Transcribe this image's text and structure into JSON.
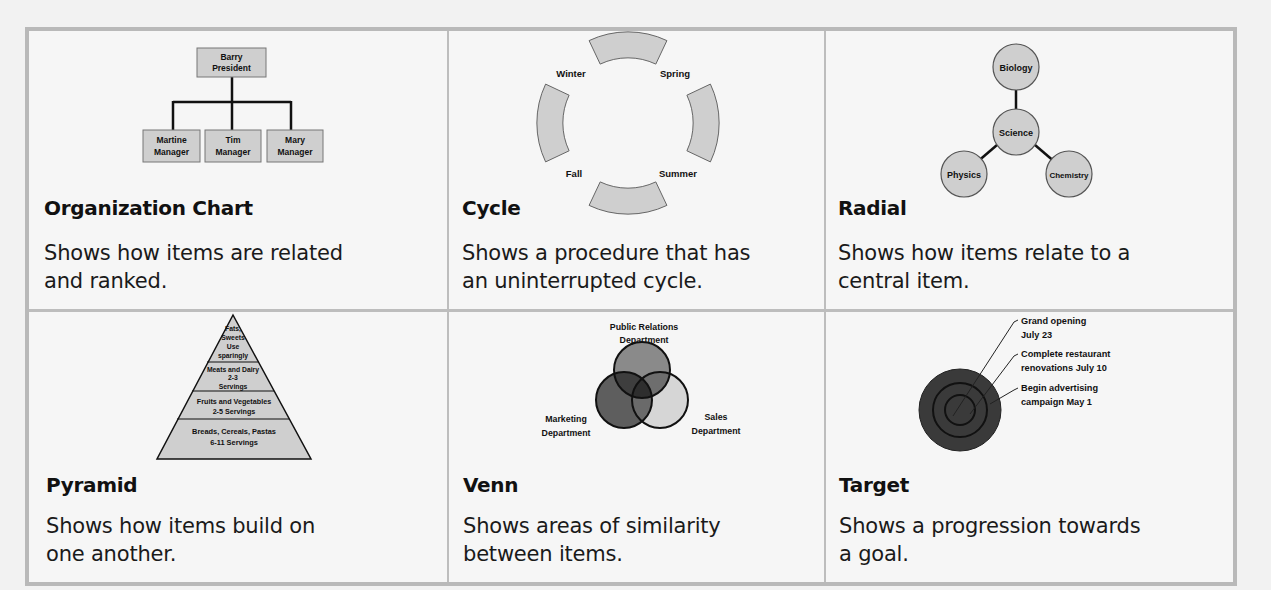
{
  "cells": [
    {
      "title": "Organization Chart",
      "description": "Shows how items are related\nand ranked.",
      "diagram": {
        "top": {
          "line1": "Barry",
          "line2": "President"
        },
        "children": [
          {
            "line1": "Martine",
            "line2": "Manager"
          },
          {
            "line1": "Tim",
            "line2": "Manager"
          },
          {
            "line1": "Mary",
            "line2": "Manager"
          }
        ]
      }
    },
    {
      "title": "Cycle",
      "description": "Shows a procedure that has\nan uninterrupted cycle.",
      "diagram": {
        "labels": [
          "Winter",
          "Spring",
          "Summer",
          "Fall"
        ]
      }
    },
    {
      "title": "Radial",
      "description": "Shows how items relate to a\ncentral item.",
      "diagram": {
        "center": "Science",
        "nodes": [
          "Biology",
          "Physics",
          "Chemistry"
        ]
      }
    },
    {
      "title": "Pyramid",
      "description": "Shows how items build on\none another.",
      "diagram": {
        "levels": [
          [
            "Fats,",
            "Sweets",
            "Use",
            "sparingly"
          ],
          [
            "Meats and Dairy",
            "2-3",
            "Servings"
          ],
          [
            "Fruits and Vegetables",
            "2-5 Servings"
          ],
          [
            "Breads, Cereals, Pastas",
            "6-11 Servings"
          ]
        ]
      }
    },
    {
      "title": "Venn",
      "description": "Shows areas of similarity\nbetween items.",
      "diagram": {
        "sets": [
          {
            "line1": "Public Relations",
            "line2": "Department"
          },
          {
            "line1": "Marketing",
            "line2": "Department"
          },
          {
            "line1": "Sales",
            "line2": "Department"
          }
        ]
      }
    },
    {
      "title": "Target",
      "description": "Shows a progression towards\na goal.",
      "diagram": {
        "callouts": [
          {
            "line1": "Grand opening",
            "line2": "July 23"
          },
          {
            "line1": "Complete restaurant",
            "line2": "renovations July 10"
          },
          {
            "line1": "Begin advertising",
            "line2": "campaign May 1"
          }
        ]
      }
    }
  ],
  "colors": {
    "frame": "#b9b9b9",
    "shape_fill": "#cfcfcf",
    "shape_stroke": "#555555",
    "venn_pr": "#8a8a8a",
    "venn_marketing": "#5e5e5e",
    "venn_sales": "#d6d6d6",
    "target": "#3a3a3a"
  }
}
